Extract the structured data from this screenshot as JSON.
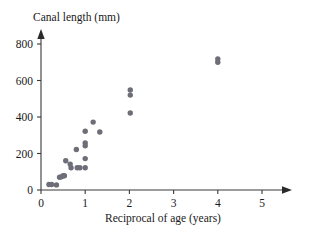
{
  "chart_data": {
    "type": "scatter",
    "title": "",
    "xlabel": "Reciprocal of age (years)",
    "ylabel": "Canal length (mm)",
    "xlim": [
      0,
      5.5
    ],
    "ylim": [
      0,
      870
    ],
    "xticks": [
      0,
      1,
      2,
      3,
      4,
      5
    ],
    "xtick_labels": [
      "0",
      "1",
      "2",
      "3",
      "4",
      "5"
    ],
    "yticks": [
      0,
      200,
      400,
      600,
      800
    ],
    "ytick_labels": [
      "0",
      "200",
      "400",
      "600",
      "800"
    ],
    "grid": false,
    "legend": null,
    "marker_color": "#6e6e78",
    "axis_color": "#3a3a3a",
    "points": [
      {
        "x": 0.18,
        "y": 30
      },
      {
        "x": 0.24,
        "y": 30
      },
      {
        "x": 0.35,
        "y": 28
      },
      {
        "x": 0.42,
        "y": 70
      },
      {
        "x": 0.46,
        "y": 72
      },
      {
        "x": 0.5,
        "y": 78
      },
      {
        "x": 0.53,
        "y": 78
      },
      {
        "x": 0.56,
        "y": 160
      },
      {
        "x": 0.66,
        "y": 142
      },
      {
        "x": 0.68,
        "y": 122
      },
      {
        "x": 0.8,
        "y": 222
      },
      {
        "x": 0.82,
        "y": 122
      },
      {
        "x": 0.88,
        "y": 122
      },
      {
        "x": 1.0,
        "y": 322
      },
      {
        "x": 1.0,
        "y": 258
      },
      {
        "x": 1.0,
        "y": 242
      },
      {
        "x": 1.0,
        "y": 172
      },
      {
        "x": 1.0,
        "y": 122
      },
      {
        "x": 1.18,
        "y": 372
      },
      {
        "x": 1.33,
        "y": 318
      },
      {
        "x": 2.02,
        "y": 548
      },
      {
        "x": 2.02,
        "y": 520
      },
      {
        "x": 2.02,
        "y": 422
      },
      {
        "x": 4.0,
        "y": 718
      },
      {
        "x": 4.0,
        "y": 700
      }
    ]
  },
  "geometry": {
    "origin_x": 41,
    "origin_y": 190,
    "x_unit_px": 44.2,
    "y_unit_px": 0.1825
  }
}
